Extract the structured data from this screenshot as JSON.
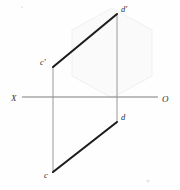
{
  "figure": {
    "type": "descriptive-geometry-projection",
    "background_color": "#fefefe",
    "canvas": {
      "width": 180,
      "height": 190
    }
  },
  "axis": {
    "name": "ground-line",
    "left_label": "X",
    "right_label": "O",
    "y": 97,
    "x_start": 22,
    "x_end": 158,
    "color": "#7d7d7d",
    "left_label_x": 13,
    "left_label_y": 100,
    "right_label_x": 163,
    "right_label_y": 101
  },
  "points": [
    {
      "id": "c-prime",
      "label": "c'",
      "x": 53,
      "y": 67,
      "label_x": 40,
      "label_y": 65,
      "plane": "frontal"
    },
    {
      "id": "d-prime",
      "label": "d'",
      "x": 117,
      "y": 14,
      "label_x": 121,
      "label_y": 12,
      "plane": "frontal"
    },
    {
      "id": "c",
      "label": "c",
      "x": 53,
      "y": 172,
      "label_x": 44,
      "label_y": 176,
      "plane": "horizontal"
    },
    {
      "id": "d",
      "label": "d",
      "x": 117,
      "y": 122,
      "label_x": 121,
      "label_y": 120,
      "plane": "horizontal"
    }
  ],
  "segments": [
    {
      "id": "frontal-projection",
      "name": "c'd'",
      "from": "c-prime",
      "to": "d-prime",
      "x1": 53,
      "y1": 67,
      "x2": 117,
      "y2": 14,
      "style": "thick",
      "color": "#1c1c1c"
    },
    {
      "id": "horizontal-projection",
      "name": "cd",
      "from": "c",
      "to": "d",
      "x1": 53,
      "y1": 172,
      "x2": 117,
      "y2": 122,
      "style": "thick",
      "color": "#1c1c1c"
    }
  ],
  "projectors": [
    {
      "id": "projector-c",
      "name": "c'-c",
      "x1": 53,
      "y1": 67,
      "x2": 53,
      "y2": 172,
      "color": "#8e8e8e"
    },
    {
      "id": "projector-d",
      "name": "d'-d",
      "x1": 117,
      "y1": 14,
      "x2": 117,
      "y2": 122,
      "color": "#8e8e8e"
    }
  ],
  "watermark": {
    "name": "hexagon-watermark",
    "visible": true,
    "color": "#fbfafa",
    "points": "112,8 152,30 152,76 112,98 72,76 72,30"
  }
}
